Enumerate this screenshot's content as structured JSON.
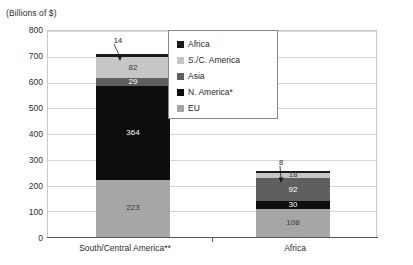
{
  "chart_data": {
    "type": "bar",
    "subtype": "stacked-bar",
    "title": "",
    "axis_unit_caption": "(Billions of $)",
    "xlabel": "",
    "ylabel": "",
    "ylim": [
      0,
      800
    ],
    "ytick_step": 100,
    "ytick_labels": [
      "800",
      "700",
      "600",
      "500",
      "400",
      "300",
      "200",
      "100",
      "0"
    ],
    "ytick_values": [
      800,
      700,
      600,
      500,
      400,
      300,
      200,
      100,
      0
    ],
    "grid": true,
    "grid_orientation": "horizontal",
    "legend_position": "top-right",
    "categories": [
      "South/Central America**",
      "Africa"
    ],
    "series": [
      {
        "name": "EU",
        "values": [
          223,
          108
        ],
        "color": "#a6a6a6",
        "label_color": "light"
      },
      {
        "name": "N. America*",
        "values": [
          364,
          30
        ],
        "color": "#0d0d0d",
        "label_color": "dark"
      },
      {
        "name": "Asia",
        "values": [
          29,
          92
        ],
        "color": "#5f5f5f",
        "label_color": "dark"
      },
      {
        "name": "S./C. America",
        "values": [
          82,
          18
        ],
        "color": "#c6c6c6",
        "label_color": "light"
      },
      {
        "name": "Africa",
        "values": [
          14,
          8
        ],
        "color": "#1a1a1a",
        "label_color": "dark"
      }
    ],
    "stack_order_bottom_to_top": [
      "EU",
      "N. America*",
      "Asia",
      "S./C. America",
      "Africa"
    ],
    "totals": [
      712,
      256
    ],
    "callouts": [
      {
        "category": "South/Central America**",
        "series": "Africa",
        "value": "14"
      },
      {
        "category": "Africa",
        "series": "Africa",
        "value": "8"
      }
    ]
  },
  "legend": {
    "items": [
      {
        "label": "Africa",
        "color": "#1a1a1a"
      },
      {
        "label": "S./C. America",
        "color": "#c6c6c6"
      },
      {
        "label": "Asia",
        "color": "#5f5f5f"
      },
      {
        "label": "N. America*",
        "color": "#0d0d0d"
      },
      {
        "label": "EU",
        "color": "#a6a6a6"
      }
    ]
  },
  "bars": {
    "bar1": {
      "category": "South/Central America**",
      "callout": "14",
      "segments": [
        {
          "name": "Africa",
          "label": "",
          "value": 14
        },
        {
          "name": "S./C. America",
          "label": "82",
          "value": 82
        },
        {
          "name": "Asia",
          "label": "29",
          "value": 29
        },
        {
          "name": "N. America*",
          "label": "364",
          "value": 364
        },
        {
          "name": "EU",
          "label": "223",
          "value": 223
        }
      ]
    },
    "bar2": {
      "category": "Africa",
      "callout": "8",
      "segments": [
        {
          "name": "Africa",
          "label": "",
          "value": 8
        },
        {
          "name": "S./C. America",
          "label": "18",
          "value": 18
        },
        {
          "name": "Asia",
          "label": "92",
          "value": 92
        },
        {
          "name": "N. America*",
          "label": "30",
          "value": 30
        },
        {
          "name": "EU",
          "label": "108",
          "value": 108
        }
      ]
    }
  },
  "yticks": {
    "t800": "800",
    "t700": "700",
    "t600": "600",
    "t500": "500",
    "t400": "400",
    "t300": "300",
    "t200": "200",
    "t100": "100",
    "t0": "0"
  }
}
